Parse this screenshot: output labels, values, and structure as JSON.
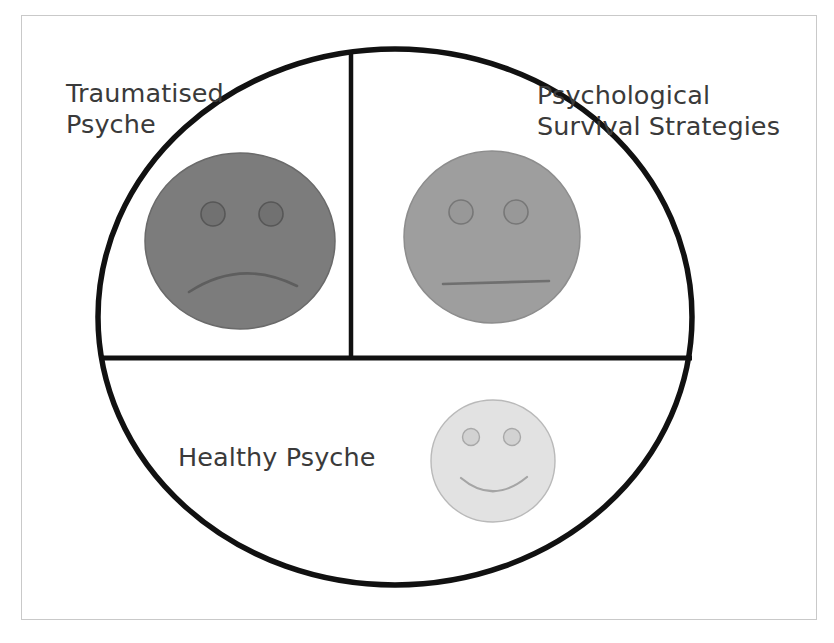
{
  "diagram": {
    "type": "circle-divided-into-three-sectors",
    "title_visible": false,
    "background_color": "#ffffff",
    "frame_color": "#c9c9c9",
    "outline_color": "#111111"
  },
  "labels": {
    "traumatised": {
      "line1": "Traumatised",
      "line2": "Psyche",
      "full": "Traumatised Psyche",
      "quadrant": "top-left"
    },
    "psychological": {
      "line1": "Psychological",
      "line2": "Survival Strategies",
      "full": "Psychological Survival Strategies",
      "quadrant": "top-right"
    },
    "healthy": {
      "line1": "Healthy Psyche",
      "full": "Healthy Psyche",
      "quadrant": "bottom"
    }
  },
  "faces": [
    {
      "name": "sad-face",
      "expression": "sad",
      "associated_label": "Traumatised Psyche",
      "fill_color": "#7c7c7c",
      "stroke_color": "#6a6a6a",
      "eye_color": "#6b6b6b",
      "mouth": "frown",
      "center": {
        "x": 240,
        "y": 241
      },
      "radius": {
        "rx": 95,
        "ry": 88
      }
    },
    {
      "name": "neutral-face",
      "expression": "neutral",
      "associated_label": "Psychological Survival Strategies",
      "fill_color": "#9e9e9e",
      "stroke_color": "#8d8d8d",
      "eye_color": "#8a8a8a",
      "mouth": "flat",
      "center": {
        "x": 492,
        "y": 237
      },
      "radius": {
        "rx": 88,
        "ry": 86
      }
    },
    {
      "name": "happy-face",
      "expression": "happy",
      "associated_label": "Healthy Psyche",
      "fill_color": "#e2e2e2",
      "stroke_color": "#b9b9b9",
      "eye_color": "#b8b8b8",
      "mouth": "smile",
      "center": {
        "x": 493,
        "y": 461
      },
      "radius": {
        "rx": 62,
        "ry": 61
      }
    }
  ],
  "geometry": {
    "main_circle": {
      "cx": 395,
      "cy": 317,
      "rx": 297,
      "ry": 268
    },
    "vertical_divider": {
      "x": 351,
      "y_top": 52,
      "y_bottom": 358
    },
    "horizontal_divider": {
      "y": 358,
      "x_left": 100,
      "x_right": 692
    }
  }
}
